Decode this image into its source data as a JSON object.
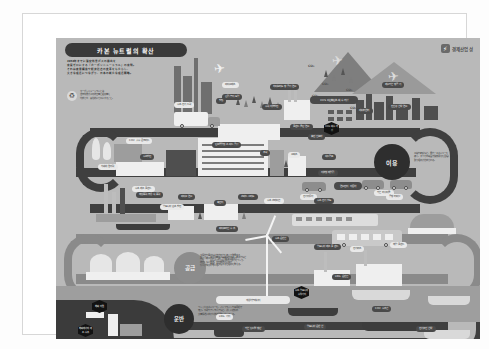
{
  "document": {
    "title": "카본 뉴트럴의 확산",
    "publisher": "경제산업성",
    "logo_mark": "flash-icon",
    "intro": "2050年までに温室効果ガスの排出を\n実質ゼロにする「カーボンニュートラル」の実現。\nそれは産業構造や経済社会の変革をもたらし、\n大きな成長につながり、日本の新たな成長戦略。",
    "recycle_note": "カーボンニュートラルとは\n温室効果ガスの排出量と吸収量を\n均衡させ、実質的にゼロにすること。"
  },
  "sections": [
    {
      "key": "use",
      "label": "이용",
      "style": "dark",
      "blurb": "工場や家庭など、電力・エネルギーを\n使う、すべての場面で脱炭素化を目指した\n取り組みが進められる。"
    },
    {
      "key": "supply",
      "label": "공급",
      "style": "grey",
      "blurb": "再生可能エネルギーや水素、原子力など\nCO2を出さない電源で電力をつくり、\n安定して供給する仕組みを整える。"
    },
    {
      "key": "transport",
      "label": "운반",
      "style": "dark",
      "blurb": "つくったエネルギーを、パイプラインや専用船で\n運ぶ。水素やアンモニアなど、新しい燃料の\n大量輸送に向けた技術開発も進んでいる。"
    }
  ],
  "badges": [
    {
      "id": "badge-co2-capture",
      "text": "CO2\n회수·저장"
    },
    {
      "id": "badge-port-hydrogen",
      "text": "수소·암모니아\n수입기지"
    },
    {
      "id": "badge-overseas-resource",
      "text": "해외\n자원"
    },
    {
      "id": "badge-overseas-production",
      "text": "해외에서의\n제조·수송"
    }
  ],
  "bottom_label": "해외로부터",
  "renewable_label": "재생가능에너지",
  "renewable_blurb": "太陽光や風力など自然の力を使って発電する\n再生可能エネルギーは、発電時にCO2を\n排出しない電源。主力電源化に向け\n導入が拡大している。",
  "labels": {
    "top_row": [
      {
        "id": "label-zev-truck",
        "text": "수소·전기 트럭",
        "variant": "light"
      },
      {
        "id": "label-building",
        "text": "빌딩",
        "variant": "dark"
      },
      {
        "id": "label-biomass",
        "text": "바이오매스",
        "variant": "light"
      },
      {
        "id": "label-forest",
        "text": "산림·농지·토양",
        "variant": "dark"
      },
      {
        "id": "label-hydro",
        "text": "수력·지열발전",
        "variant": "dark"
      },
      {
        "id": "label-hybrid-air",
        "text": "하이브리드 항공기 연료",
        "variant": "dark"
      },
      {
        "id": "label-ccs",
        "text": "CCS\n이산화탄소 회수·저장",
        "variant": "dark"
      },
      {
        "id": "label-plant-clean",
        "text": "플랜트 클린 연료",
        "variant": "dark"
      },
      {
        "id": "label-zero-air",
        "text": "제로카본 항공기",
        "variant": "dark"
      },
      {
        "id": "label-ship-fuel",
        "text": "친환경 선박 연료",
        "variant": "dark"
      },
      {
        "id": "label-data",
        "text": "데이터센터",
        "variant": "dark"
      }
    ],
    "mid_row": [
      {
        "id": "label-co2-concrete",
        "text": "CO2 흡수 콘크리트",
        "variant": "light"
      },
      {
        "id": "label-nuclear",
        "text": "차세대 원자력",
        "variant": "light"
      },
      {
        "id": "label-hydrogen-gen",
        "text": "수소발전",
        "variant": "dark"
      },
      {
        "id": "label-zero-factory",
        "text": "탄소중립형 스마트 공장",
        "variant": "dark"
      },
      {
        "id": "label-home",
        "text": "주택",
        "variant": "dark"
      },
      {
        "id": "label-office",
        "text": "오피스",
        "variant": "light"
      },
      {
        "id": "label-ev-charge",
        "text": "충전 인프라",
        "variant": "dark"
      },
      {
        "id": "label-heat-pump",
        "text": "히트펌프",
        "variant": "dark"
      },
      {
        "id": "label-ev-car",
        "text": "전기자동차",
        "variant": "light"
      },
      {
        "id": "label-fuelcell-car",
        "text": "연료전지\n자동차",
        "variant": "dark"
      },
      {
        "id": "label-solar-roof",
        "text": "지붕형 태양광",
        "variant": "dark"
      },
      {
        "id": "label-carbon-recycle",
        "text": "카본 리사이클",
        "variant": "dark"
      }
    ],
    "low_row": [
      {
        "id": "label-offshore-wind",
        "text": "해상풍력·부유식 풍력",
        "variant": "dark"
      },
      {
        "id": "label-ammonia-mix",
        "text": "암모니아 혼소발전",
        "variant": "light"
      },
      {
        "id": "label-biofuel",
        "text": "바이오 연료",
        "variant": "dark"
      },
      {
        "id": "label-storage",
        "text": "축전지",
        "variant": "dark"
      },
      {
        "id": "label-smart-grid",
        "text": "스마트 그리드",
        "variant": "dark"
      },
      {
        "id": "label-hydrogen-station",
        "text": "수소 스테이션",
        "variant": "light"
      },
      {
        "id": "label-train",
        "text": "수소·전기 철도",
        "variant": "dark"
      },
      {
        "id": "label-bus",
        "text": "전기버스",
        "variant": "light"
      },
      {
        "id": "label-airport",
        "text": "공항 터미널",
        "variant": "light"
      },
      {
        "id": "label-pipeline",
        "text": "파이프라인 수송",
        "variant": "dark"
      },
      {
        "id": "label-hydrogen-plant",
        "text": "수소 제조 플랜트",
        "variant": "light"
      }
    ],
    "bottom_row": [
      {
        "id": "label-ammonia-plant",
        "text": "암모니아 제조 플랜트",
        "variant": "dark"
      },
      {
        "id": "label-lng-ship",
        "text": "LNG 운반선",
        "variant": "dark"
      },
      {
        "id": "label-hydrogen-ship",
        "text": "수소 운반선",
        "variant": "dark"
      },
      {
        "id": "label-ammonia-ship",
        "text": "암모니아 운반선",
        "variant": "dark"
      },
      {
        "id": "label-co2-ship",
        "text": "CO2 수송선",
        "variant": "dark"
      },
      {
        "id": "label-offshore-plant",
        "text": "해양 플랜트",
        "variant": "light"
      },
      {
        "id": "label-tanker",
        "text": "전기추진 선박",
        "variant": "dark"
      },
      {
        "id": "label-port",
        "text": "카본 뉴트럴 항만",
        "variant": "dark"
      },
      {
        "id": "label-lng-base",
        "text": "LNG 기지",
        "variant": "light"
      }
    ]
  },
  "co2_marks": [
    "CO₂",
    "CO₂",
    "CO₂",
    "CO₂",
    "CO₂",
    "CO₂"
  ],
  "colors": {
    "poster_bg": "#b9b9b9",
    "road_dark": "#3f3f3f",
    "road_grey": "#8a8a8a",
    "pill_dark": "#4a4a4a",
    "pill_light": "#e9e9e9",
    "badge": "#121212",
    "page": "#ffffff"
  }
}
